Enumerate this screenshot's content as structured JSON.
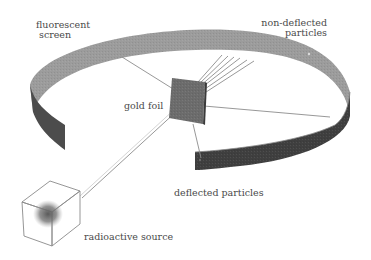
{
  "diagram": {
    "labels": {
      "fluorescent_screen_line1": "fluorescent",
      "fluorescent_screen_line2": "screen",
      "non_deflected_line1": "non-deflected",
      "non_deflected_line2": "particles",
      "gold_foil": "gold foil",
      "deflected_particles": "deflected particles",
      "radioactive_source": "radioactive source"
    },
    "colors": {
      "background": "#ffffff",
      "screen_outer_light": "#9a9a9a",
      "screen_inner_dark": "#4f4f4f",
      "screen_front_dark": "#3e3e3e",
      "foil": "#6a6a6a",
      "beam_lines": "#8a8a8a",
      "source_glow": "#6e6e6e",
      "text": "#4a4a4a"
    }
  }
}
